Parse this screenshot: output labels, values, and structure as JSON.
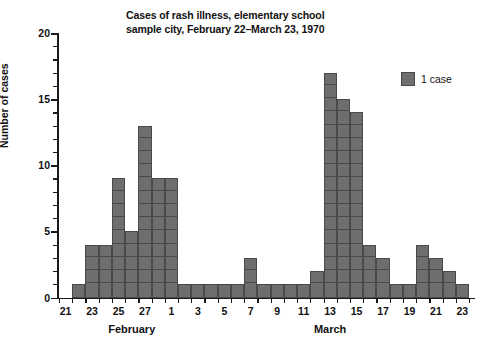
{
  "chart_data": {
    "type": "bar",
    "title": "Cases of rash illness, elementary school sample city, February 22–March 23, 1970",
    "title_line1": "Cases of rash illness, elementary school",
    "title_line2": "sample city, February 22–March 23, 1970",
    "xlabel": "",
    "ylabel": "Number of cases",
    "ylim": [
      0,
      20
    ],
    "ytick_step": 5,
    "yminor_step": 1,
    "grid": false,
    "legend_position": "top-right",
    "legend": [
      {
        "label": "1 case",
        "color": "#6e6e6e"
      }
    ],
    "month_groups": [
      {
        "label": "February",
        "center_category": "Feb 26"
      },
      {
        "label": "March",
        "center_category": "Mar 13"
      }
    ],
    "ytick_labels": [
      "0",
      "5",
      "10",
      "15",
      "20"
    ],
    "ytick_values": [
      0,
      5,
      10,
      15,
      20
    ],
    "categories": [
      "Feb 21",
      "Feb 22",
      "Feb 23",
      "Feb 24",
      "Feb 25",
      "Feb 26",
      "Feb 27",
      "Feb 28",
      "Mar 1",
      "Mar 2",
      "Mar 3",
      "Mar 4",
      "Mar 5",
      "Mar 6",
      "Mar 7",
      "Mar 8",
      "Mar 9",
      "Mar 10",
      "Mar 11",
      "Mar 12",
      "Mar 13",
      "Mar 14",
      "Mar 15",
      "Mar 16",
      "Mar 17",
      "Mar 18",
      "Mar 19",
      "Mar 20",
      "Mar 21",
      "Mar 22",
      "Mar 23"
    ],
    "tick_labels": [
      "21",
      "",
      "23",
      "",
      "25",
      "",
      "27",
      "",
      "1",
      "",
      "3",
      "",
      "5",
      "",
      "7",
      "",
      "9",
      "",
      "11",
      "",
      "13",
      "",
      "15",
      "",
      "17",
      "",
      "19",
      "",
      "21",
      "",
      "23"
    ],
    "values": [
      0,
      1,
      4,
      4,
      9,
      5,
      13,
      9,
      9,
      1,
      1,
      1,
      1,
      1,
      3,
      1,
      1,
      1,
      1,
      2,
      17,
      15,
      14,
      4,
      3,
      1,
      1,
      4,
      3,
      2,
      1
    ],
    "bar_color": "#6e6e6e",
    "bar_edge_color": "#4a4a4a"
  }
}
